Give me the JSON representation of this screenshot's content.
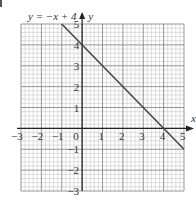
{
  "chart_data": {
    "type": "line",
    "title": "",
    "equation_label": "y = −x + 4",
    "xlabel": "x",
    "ylabel": "y",
    "xlim": [
      -3,
      5
    ],
    "ylim": [
      -3,
      5
    ],
    "x_ticks": [
      -3,
      -2,
      -1,
      0,
      1,
      2,
      3,
      4,
      5
    ],
    "x_tick_labels": [
      "−3",
      "−2",
      "−1",
      "0",
      "1",
      "2",
      "3",
      "4",
      "5"
    ],
    "y_ticks": [
      -3,
      -2,
      -1,
      1,
      2,
      3,
      4,
      5
    ],
    "y_tick_labels": [
      "−3",
      "−2",
      "−1",
      "1",
      "2",
      "3",
      "4",
      "5"
    ],
    "grid": true,
    "minor_subdivisions": 5,
    "series": [
      {
        "name": "y = −x + 4",
        "x": [
          -1,
          5
        ],
        "y": [
          5,
          -1
        ],
        "color": "#444444"
      }
    ]
  },
  "colors": {
    "minor_grid": "#c8c8c8",
    "major_grid": "#8a8a8a",
    "axis": "#222222",
    "line": "#444444"
  }
}
